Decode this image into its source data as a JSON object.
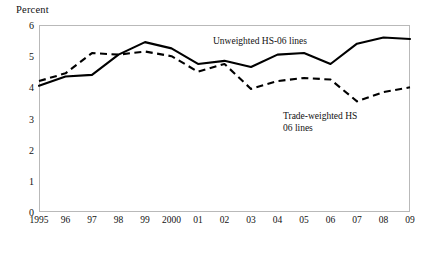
{
  "chart_data": {
    "type": "line",
    "title": "",
    "xlabel": "",
    "ylabel": "Percent",
    "ylim": [
      0,
      6
    ],
    "yticks": [
      0,
      1,
      2,
      3,
      4,
      5,
      6
    ],
    "grid": false,
    "legend_position": "inline-annotation",
    "categories": [
      "1995",
      "96",
      "97",
      "98",
      "99",
      "2000",
      "01",
      "02",
      "03",
      "04",
      "05",
      "06",
      "07",
      "08",
      "09"
    ],
    "x_values": [
      1995,
      1996,
      1997,
      1998,
      1999,
      2000,
      2001,
      2002,
      2003,
      2004,
      2005,
      2006,
      2007,
      2008,
      2009
    ],
    "series": [
      {
        "name": "Unweighted HS-06 lines",
        "style": "solid",
        "color": "#000000",
        "values": [
          4.05,
          4.35,
          4.4,
          5.05,
          5.45,
          5.25,
          4.75,
          4.85,
          4.65,
          5.05,
          5.1,
          4.75,
          5.4,
          5.6,
          5.55
        ]
      },
      {
        "name": "Trade-weighted HS-06 lines",
        "style": "dashed",
        "color": "#000000",
        "values": [
          4.2,
          4.45,
          5.1,
          5.05,
          5.15,
          5.0,
          4.5,
          4.75,
          3.95,
          4.2,
          4.3,
          4.25,
          3.55,
          3.85,
          4.0
        ]
      }
    ],
    "annotations": [
      {
        "id": "unweighted",
        "text": "Unweighted HS-06 lines"
      },
      {
        "id": "tradeweighted",
        "text": "Trade-weighted HS\n06 lines"
      }
    ]
  }
}
